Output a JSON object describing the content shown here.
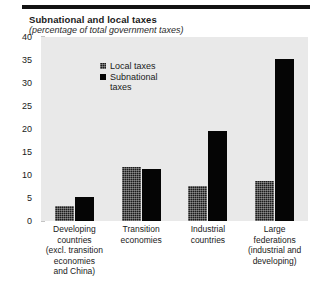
{
  "chart_data": {
    "type": "bar",
    "title": "Subnational and local taxes",
    "subtitle": "(percentage of  total government taxes)",
    "xlabel": "",
    "ylabel": "",
    "ylim": [
      0,
      40
    ],
    "yticks": [
      0,
      5,
      10,
      15,
      20,
      25,
      30,
      35,
      40
    ],
    "ytick_labels": [
      "0",
      "5",
      "10",
      "15",
      "20",
      "25",
      "30",
      "35",
      "40"
    ],
    "grid": false,
    "legend_position": "upper-left-inside",
    "categories": [
      "Developing\ncountries\n(excl. transition\neconomies\nand China)",
      "Transition\neconomies",
      "Industrial\ncountries",
      "Large\nfederations\n(industrial and\ndeveloping)"
    ],
    "series": [
      {
        "name": "Local taxes",
        "color": "#1b1b1b",
        "fill": "speckled",
        "values": [
          3.2,
          11.8,
          7.6,
          8.6
        ]
      },
      {
        "name": "Subnational\ntaxes",
        "color": "#050505",
        "fill": "solid",
        "values": [
          5.2,
          11.4,
          19.5,
          35.3
        ]
      }
    ]
  },
  "legend": {
    "items": [
      {
        "label": "Local taxes"
      },
      {
        "label": "Subnational\ntaxes"
      }
    ]
  },
  "colors": {
    "plot_background": "#e9e9e9",
    "page_background": "#ffffff",
    "rule": "#121212",
    "text": "#1a1a1a"
  }
}
